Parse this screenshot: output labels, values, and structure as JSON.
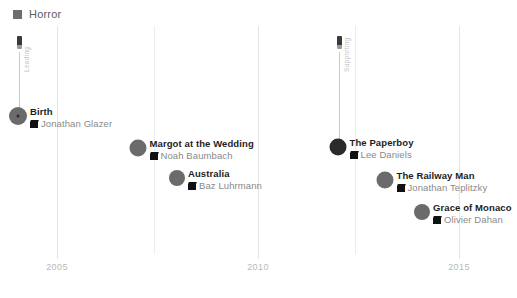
{
  "legend": {
    "label": "Horror",
    "color": "#6e6e6e",
    "icon": "square-swatch-icon"
  },
  "axis": {
    "ticks": [
      {
        "label": "2005",
        "x": 57
      },
      {
        "label": "2010",
        "x": 258
      },
      {
        "label": "2015",
        "x": 459
      }
    ],
    "gridlines_x": [
      57,
      154,
      258,
      355,
      459
    ],
    "grid": true,
    "ylabel": "",
    "xlabel": ""
  },
  "connectors": [
    {
      "name": "left-connector",
      "text": "Leading",
      "x": 19,
      "top": 36,
      "stem_top": 52,
      "stem_height": 64,
      "icon": "film-strip-icon"
    },
    {
      "name": "right-connector",
      "text": "Supporting",
      "x": 339,
      "top": 36,
      "stem_top": 52,
      "stem_height": 95,
      "icon": "film-strip-icon"
    }
  ],
  "chart_data": {
    "type": "scatter",
    "title": "",
    "xlabel": "",
    "ylabel": "",
    "xlim": [
      2003.5,
      2016.2
    ],
    "grid": true,
    "legend": [
      "Horror"
    ],
    "legend_position": "top-left",
    "categories": [
      "Birth",
      "Margot at the Wedding",
      "Australia",
      "The Paperboy",
      "The Railway Man",
      "Grace of Monaco"
    ],
    "points": [
      {
        "title": "Birth",
        "director": "Jonathan Glazer",
        "year": 2004,
        "cx": 18,
        "cy": 116,
        "r": 9,
        "color": "#6b6b6b",
        "center_dot": true
      },
      {
        "title": "Margot at the Wedding",
        "director": "Noah Baumbach",
        "year": 2007,
        "cx": 138,
        "cy": 148,
        "r": 8.5,
        "color": "#6b6b6b",
        "center_dot": false
      },
      {
        "title": "Australia",
        "director": "Baz Luhrmann",
        "year": 2008,
        "cx": 177,
        "cy": 178,
        "r": 8,
        "color": "#6b6b6b",
        "center_dot": false
      },
      {
        "title": "The Paperboy",
        "director": "Lee Daniels",
        "year": 2012,
        "cx": 338,
        "cy": 147,
        "r": 8.5,
        "color": "#2a2a2a",
        "center_dot": true
      },
      {
        "title": "The Railway Man",
        "director": "Jonathan Teplitzky",
        "year": 2013,
        "cx": 385,
        "cy": 180,
        "r": 8.5,
        "color": "#6b6b6b",
        "center_dot": false
      },
      {
        "title": "Grace of Monaco",
        "director": "Olivier Dahan",
        "year": 2014,
        "cx": 422,
        "cy": 212,
        "r": 8,
        "color": "#6b6b6b",
        "center_dot": false
      }
    ]
  }
}
